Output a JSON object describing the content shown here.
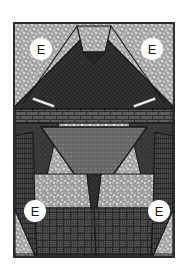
{
  "figure": {
    "background_color": "#ffffff",
    "border_color": "#2b2b2b",
    "frame": {
      "x": 13,
      "y": 22,
      "width": 162,
      "height": 236
    }
  },
  "palette": {
    "light_speckle": "#a8a8a8",
    "light_speckle_dot": "#d8d8d8",
    "mid_gray": "#6d6d6d",
    "dark_gray": "#3a3a3a",
    "very_dark": "#2a2a2a",
    "brick_band": "#4a4a4a",
    "basketweave": "#3c3c3c",
    "seam_line": "#1a1a1a",
    "accent_white": "#f2f2f2"
  },
  "labels": [
    {
      "id": "label-top-left",
      "text": "E",
      "x": 28,
      "y": 36,
      "position": "top-left"
    },
    {
      "id": "label-top-right",
      "text": "E",
      "x": 139,
      "y": 36,
      "position": "top-right"
    },
    {
      "id": "label-bottom-left",
      "text": "E",
      "x": 22,
      "y": 198,
      "position": "bottom-left"
    },
    {
      "id": "label-bottom-right",
      "text": "E",
      "x": 146,
      "y": 198,
      "position": "bottom-right"
    }
  ],
  "pieces": [
    {
      "name": "background-upper-left",
      "fill": "light-speckle",
      "shape": "corner-triangle"
    },
    {
      "name": "background-upper-right",
      "fill": "light-speckle",
      "shape": "corner-triangle"
    },
    {
      "name": "top-center-notch",
      "fill": "light-speckle",
      "shape": "trapezoid"
    },
    {
      "name": "upper-large-triangle",
      "fill": "very-dark",
      "shape": "triangle"
    },
    {
      "name": "left-white-sliver",
      "fill": "accent-white",
      "shape": "sliver"
    },
    {
      "name": "right-white-sliver",
      "fill": "accent-white",
      "shape": "sliver"
    },
    {
      "name": "brick-band",
      "fill": "brick-band",
      "shape": "horizontal-band"
    },
    {
      "name": "left-small-triangle",
      "fill": "accent-white",
      "shape": "small-triangle"
    },
    {
      "name": "right-small-triangle",
      "fill": "accent-white",
      "shape": "small-triangle"
    },
    {
      "name": "center-inverted-triangle",
      "fill": "mid-gray",
      "shape": "inverted-triangle"
    },
    {
      "name": "left-side-strip",
      "fill": "dark-gray",
      "shape": "vertical-strip"
    },
    {
      "name": "right-side-strip",
      "fill": "dark-gray",
      "shape": "vertical-strip"
    },
    {
      "name": "left-light-rectangle",
      "fill": "light-speckle",
      "shape": "rectangle"
    },
    {
      "name": "right-light-rectangle",
      "fill": "light-speckle",
      "shape": "rectangle"
    },
    {
      "name": "bottom-basketweave",
      "fill": "basketweave",
      "shape": "rectangle"
    },
    {
      "name": "bottom-left-corner-triangle",
      "fill": "light-speckle",
      "shape": "corner-triangle"
    },
    {
      "name": "bottom-right-corner-triangle",
      "fill": "light-speckle",
      "shape": "corner-triangle"
    }
  ]
}
